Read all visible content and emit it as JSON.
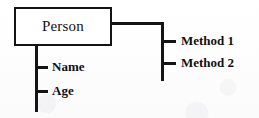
{
  "diagram": {
    "type": "uml-class-diagram",
    "class_box": {
      "title": "Person"
    },
    "attributes": {
      "branch_side": "left",
      "items": [
        {
          "label": "Name"
        },
        {
          "label": "Age"
        }
      ]
    },
    "methods": {
      "branch_side": "right",
      "items": [
        {
          "label": "Method 1"
        },
        {
          "label": "Method 2"
        }
      ]
    },
    "colors": {
      "stroke": "#141414",
      "text": "#111111",
      "background": "#fdfdfd",
      "box_fill": "#ffffff"
    }
  }
}
